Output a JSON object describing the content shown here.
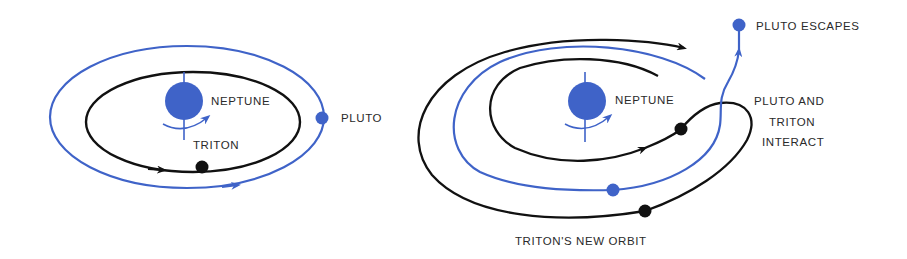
{
  "colors": {
    "blue": "#3f63c8",
    "black": "#111111",
    "text": "#2a2a2a",
    "background": "#ffffff"
  },
  "left_panel": {
    "planet_label": "NEPTUNE",
    "moon_label": "TRITON",
    "outer_body_label": "PLUTO"
  },
  "right_panel": {
    "planet_label": "NEPTUNE",
    "escape_label": "PLUTO ESCAPES",
    "interact_label_line1": "PLUTO AND",
    "interact_label_line2": "TRITON",
    "interact_label_line3": "INTERACT",
    "new_orbit_label": "TRITON'S NEW ORBIT"
  }
}
